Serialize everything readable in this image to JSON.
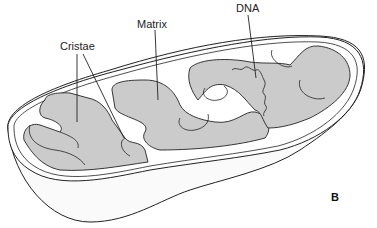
{
  "diagram": {
    "panel_letter": "B",
    "labels": [
      {
        "id": "cristae",
        "text": "Cristae"
      },
      {
        "id": "matrix",
        "text": "Matrix"
      },
      {
        "id": "dna",
        "text": "DNA"
      }
    ],
    "colors": {
      "outline": "#222222",
      "matrix_fill": "#c9c9c9",
      "membrane_fill": "#ffffff",
      "background": "#ffffff"
    }
  }
}
